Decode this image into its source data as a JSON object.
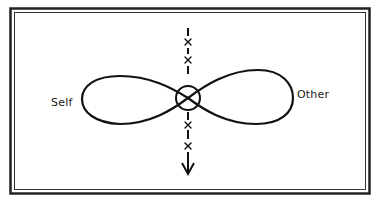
{
  "diagram": {
    "type": "figure-eight relationship diagram",
    "labels": {
      "left": "Self",
      "right": "Other"
    },
    "center_marker": "circle-with-cross",
    "vertical_axis": {
      "style": "dashed line with x marks",
      "direction": "down",
      "marks": [
        "x",
        "x",
        "x",
        "x"
      ]
    },
    "frame": "double-line border",
    "colors": {
      "stroke": "#111111",
      "background": "#ffffff",
      "text": "#1a1a1a"
    }
  }
}
